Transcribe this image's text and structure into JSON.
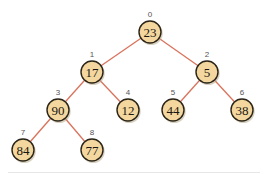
{
  "diagram": {
    "type": "binary-heap-tree",
    "colors": {
      "edge": "#d9735c",
      "node_fill": "#f4d79e",
      "node_stroke": "#2a2418",
      "index_label": "#555555",
      "value_text": "#1a1712"
    },
    "nodes": [
      {
        "index": "0",
        "value": "23",
        "x": 150,
        "y": 32
      },
      {
        "index": "1",
        "value": "17",
        "x": 92,
        "y": 72
      },
      {
        "index": "2",
        "value": "5",
        "x": 207,
        "y": 72
      },
      {
        "index": "3",
        "value": "90",
        "x": 58,
        "y": 110
      },
      {
        "index": "4",
        "value": "12",
        "x": 128,
        "y": 110
      },
      {
        "index": "5",
        "value": "44",
        "x": 173,
        "y": 110
      },
      {
        "index": "6",
        "value": "38",
        "x": 242,
        "y": 110
      },
      {
        "index": "7",
        "value": "84",
        "x": 23,
        "y": 150
      },
      {
        "index": "8",
        "value": "77",
        "x": 92,
        "y": 150
      }
    ],
    "edges": [
      {
        "from": 0,
        "to": 1
      },
      {
        "from": 0,
        "to": 2
      },
      {
        "from": 1,
        "to": 3
      },
      {
        "from": 1,
        "to": 4
      },
      {
        "from": 2,
        "to": 5
      },
      {
        "from": 2,
        "to": 6
      },
      {
        "from": 3,
        "to": 7
      },
      {
        "from": 3,
        "to": 8
      }
    ]
  }
}
